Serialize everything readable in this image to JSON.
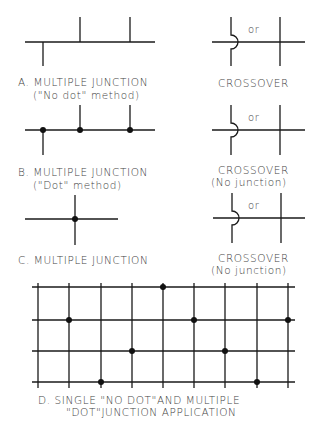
{
  "sections": {
    "a": {
      "title": "A. MULTIPLE JUNCTION",
      "subtitle": "(\"No dot\" method)",
      "crossover_title": "CROSSOVER",
      "or_label": "or"
    },
    "b": {
      "title": "B. MULTIPLE JUNCTION",
      "subtitle": "(\"Dot\" method)",
      "crossover_title": "CROSSOVER",
      "crossover_subtitle": "(No junction)",
      "or_label": "or"
    },
    "c": {
      "title": "C. MULTIPLE JUNCTION",
      "crossover_title": "CROSSOVER",
      "crossover_subtitle": "(No junction)",
      "or_label": "or"
    },
    "d": {
      "title_line1": "D. SINGLE \"NO DOT\"AND MULTIPLE",
      "title_line2": "\"DOT\"JUNCTION APPLICATION",
      "grid": {
        "vertical_x": [
          38,
          69,
          101,
          132,
          163,
          194,
          225,
          257,
          288
        ],
        "horizontal_y": [
          287,
          320,
          351,
          382
        ],
        "dots": [
          [
            163,
            287
          ],
          [
            69,
            320
          ],
          [
            194,
            320
          ],
          [
            288,
            320
          ],
          [
            132,
            351
          ],
          [
            225,
            351
          ],
          [
            101,
            382
          ],
          [
            257,
            382
          ]
        ]
      }
    }
  },
  "colors": {
    "line": "#1a1a1a",
    "text": "#444444",
    "background": "#ffffff"
  }
}
